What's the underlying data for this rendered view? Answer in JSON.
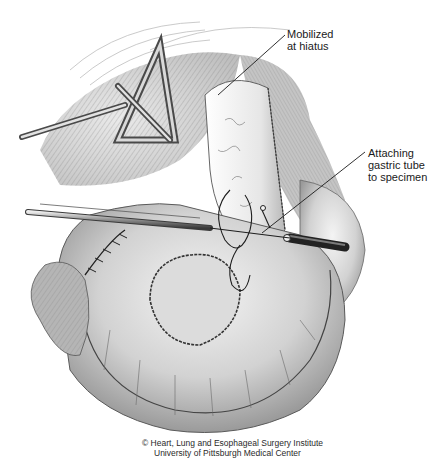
{
  "figure": {
    "type": "surgical-illustration",
    "style": "grayscale pencil sketch",
    "colors": {
      "background": "#ffffff",
      "ink": "#1a1a1a",
      "shade_dark": "#6b6b6b",
      "shade_mid": "#a8a8a8",
      "shade_light": "#d9d9d9"
    }
  },
  "callouts": [
    {
      "id": "hiatus",
      "lines": [
        "Mobilized",
        "at hiatus"
      ]
    },
    {
      "id": "gastric",
      "lines": [
        "Attaching",
        "gastric tube",
        "to specimen"
      ]
    }
  ],
  "credit": {
    "line1": "© Heart, Lung and Esophageal Surgery Institute",
    "line2": "University of Pittsburgh Medical Center"
  }
}
